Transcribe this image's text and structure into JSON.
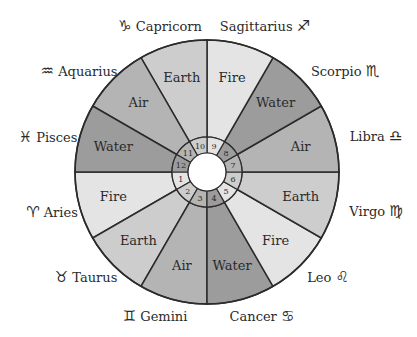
{
  "diagram": {
    "type": "zodiac-wheel",
    "colors": {
      "Fire": "#e4e4e4",
      "Earth": "#cdcdcd",
      "Air": "#b4b4b4",
      "Water": "#9c9c9c",
      "outline": "#2b2b2b",
      "center": "#ffffff"
    },
    "houses": [
      {
        "number": "1",
        "sign": "Aries",
        "glyph": "♈︎",
        "element": "Fire"
      },
      {
        "number": "2",
        "sign": "Taurus",
        "glyph": "♉︎",
        "element": "Earth"
      },
      {
        "number": "3",
        "sign": "Gemini",
        "glyph": "♊︎",
        "element": "Air"
      },
      {
        "number": "4",
        "sign": "Cancer",
        "glyph": "♋︎",
        "element": "Water"
      },
      {
        "number": "5",
        "sign": "Leo",
        "glyph": "♌︎",
        "element": "Fire"
      },
      {
        "number": "6",
        "sign": "Virgo",
        "glyph": "♍︎",
        "element": "Earth"
      },
      {
        "number": "7",
        "sign": "Libra",
        "glyph": "♎︎",
        "element": "Air"
      },
      {
        "number": "8",
        "sign": "Scorpio",
        "glyph": "♏︎",
        "element": "Water"
      },
      {
        "number": "9",
        "sign": "Sagittarius",
        "glyph": "♐︎",
        "element": "Fire"
      },
      {
        "number": "10",
        "sign": "Capricorn",
        "glyph": "♑︎",
        "element": "Earth"
      },
      {
        "number": "11",
        "sign": "Aquarius",
        "glyph": "♒︎",
        "element": "Air"
      },
      {
        "number": "12",
        "sign": "Pisces",
        "glyph": "♓︎",
        "element": "Water"
      }
    ]
  }
}
